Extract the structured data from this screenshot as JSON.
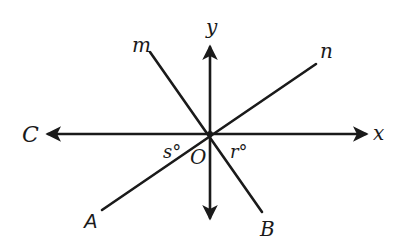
{
  "diagram": {
    "type": "intersecting-lines",
    "origin_label": "O",
    "axes": {
      "x_label": "x",
      "y_label": "y",
      "left_point_label": "C"
    },
    "lines": {
      "m_label": "m",
      "n_label": "n",
      "A_label": "A",
      "B_label": "B"
    },
    "angles": {
      "s_label": "s°",
      "r_label": "r°"
    },
    "colors": {
      "ink": "#1a1a1a",
      "background": "#ffffff"
    }
  }
}
